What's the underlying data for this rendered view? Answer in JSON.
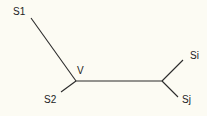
{
  "diagram": {
    "type": "phylogenetic-tree",
    "line_color": "#2a2a2a",
    "background": "#fcfbf3",
    "nodes": {
      "S1": {
        "label": "S1"
      },
      "S2": {
        "label": "S2"
      },
      "V": {
        "label": "V"
      },
      "Si": {
        "label": "Si"
      },
      "Sj": {
        "label": "Sj"
      }
    },
    "edges": [
      {
        "from": "S1",
        "to": "V"
      },
      {
        "from": "S2",
        "to": "V"
      },
      {
        "from": "V",
        "to": "U"
      },
      {
        "from": "U",
        "to": "Si"
      },
      {
        "from": "U",
        "to": "Sj"
      }
    ]
  }
}
